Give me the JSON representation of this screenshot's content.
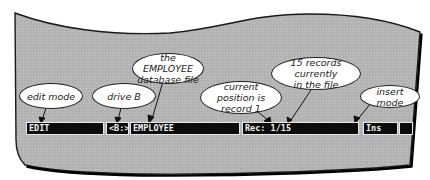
{
  "figure": {
    "top_cut_text": "                                                              "
  },
  "callouts": {
    "edit_mode": "edit mode",
    "drive_b": "drive B",
    "employee_file_line1": "the EMPLOYEE",
    "employee_file_line2": "database file",
    "current_position_line1": "current position is",
    "current_position_line2": "record 1",
    "records_count_line1": "15 records currently",
    "records_count_line2": "in the file",
    "insert_mode": "insert mode"
  },
  "status_bar": {
    "mode": "EDIT",
    "drive": "<B:>",
    "file": "EMPLOYEE",
    "record": "Rec: 1/15",
    "insert": "Ins",
    "blank": ""
  },
  "colors": {
    "screen_fill": "#b4b4b4",
    "screen_border": "#1a1a1a",
    "status_bg": "#0c0c0c",
    "status_text": "#f2f2f2",
    "bubble_fill": "#ffffff"
  }
}
